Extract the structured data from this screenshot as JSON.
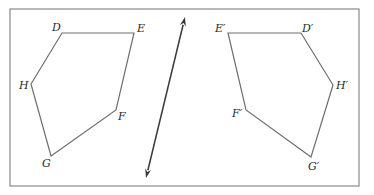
{
  "diagram": {
    "colors": {
      "frame": "#8a8a8a",
      "polygon": "#6e6e6e",
      "reflection_line": "#3a3a3a",
      "label": "#2a2a2a"
    },
    "frame": {
      "x": 10,
      "y": 9,
      "width": 349,
      "height": 177
    },
    "reflection_line": {
      "x1": 185,
      "y1": 17,
      "x2": 146,
      "y2": 178,
      "arrows": "both"
    },
    "original": {
      "name": "DEFGH",
      "vertices": [
        {
          "label": "D",
          "x": 62,
          "y": 33,
          "lx": 52,
          "ly": 31
        },
        {
          "label": "E",
          "x": 134,
          "y": 33,
          "lx": 137,
          "ly": 32
        },
        {
          "label": "F",
          "x": 116,
          "y": 110,
          "lx": 118,
          "ly": 120
        },
        {
          "label": "G",
          "x": 51,
          "y": 156,
          "lx": 42,
          "ly": 167
        },
        {
          "label": "H",
          "x": 31,
          "y": 84,
          "lx": 19,
          "ly": 89
        }
      ]
    },
    "image": {
      "name": "D'E'F'G'H'",
      "vertices": [
        {
          "label": "D′",
          "x": 301,
          "y": 33,
          "lx": 302,
          "ly": 32
        },
        {
          "label": "E′",
          "x": 228,
          "y": 33,
          "lx": 215,
          "ly": 32
        },
        {
          "label": "F′",
          "x": 246,
          "y": 110,
          "lx": 232,
          "ly": 117
        },
        {
          "label": "G′",
          "x": 311,
          "y": 157,
          "lx": 308,
          "ly": 170
        },
        {
          "label": "H′",
          "x": 333,
          "y": 85,
          "lx": 336,
          "ly": 89
        }
      ]
    }
  }
}
